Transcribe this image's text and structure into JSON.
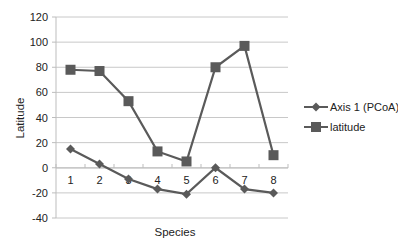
{
  "chart_data": {
    "type": "line",
    "title": "",
    "xlabel": "Species",
    "ylabel": "Latitude",
    "categories": [
      "1",
      "2",
      "3",
      "4",
      "5",
      "6",
      "7",
      "8"
    ],
    "ylim": [
      -40,
      120
    ],
    "yticks": [
      -40,
      -20,
      0,
      20,
      40,
      60,
      80,
      100,
      120
    ],
    "grid": true,
    "legend_position": "right",
    "series": [
      {
        "name": "Axis 1 (PCoA)",
        "marker": "diamond",
        "color": "#5a5a5a",
        "values": [
          15,
          3,
          -9,
          -17,
          -21,
          0,
          -17,
          -20
        ]
      },
      {
        "name": "latitude",
        "marker": "square",
        "color": "#5a5a5a",
        "values": [
          78,
          77,
          53,
          13,
          5,
          80,
          97,
          10
        ]
      }
    ]
  }
}
